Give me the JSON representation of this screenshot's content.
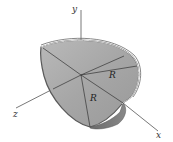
{
  "diagram": {
    "axes": {
      "y": {
        "label": "y"
      },
      "x": {
        "label": "x"
      },
      "z": {
        "label": "z"
      }
    },
    "dimensions": [
      {
        "label": "R"
      },
      {
        "label": "R"
      }
    ],
    "colors": {
      "shell_fill": "#a9a9a9",
      "shell_rim": "#6e6e6e",
      "axis": "#555555",
      "background": "#ffffff"
    }
  }
}
